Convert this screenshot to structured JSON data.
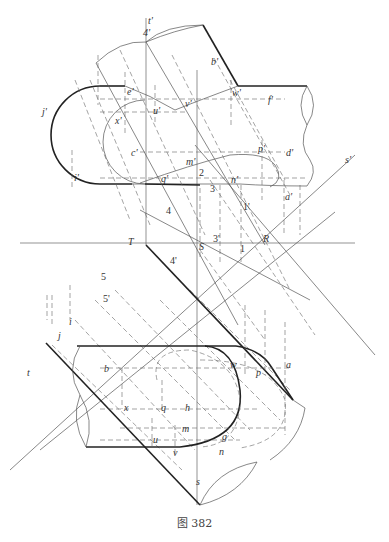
{
  "figure": {
    "caption": "图 382"
  },
  "labels": {
    "top_view": {
      "t_prime": "t'",
      "four_prime_top": "4'",
      "b_prime": "b'",
      "e_prime": "e'",
      "u_prime": "u'",
      "v_prime": "v'",
      "w_prime": "w'",
      "f_prime": "f'",
      "j_prime": "j'",
      "x_prime": "x'",
      "c_prime": "c'",
      "m_prime": "m'",
      "p_prime": "p'",
      "d_prime": "d'",
      "s_prime": "s'",
      "i_prime": "i'",
      "q_prime": "q'",
      "two": "2",
      "n_prime": "n'",
      "three": "3",
      "a_prime": "a'",
      "one_prime": "1'"
    },
    "middle": {
      "four": "4",
      "T": "T",
      "S": "S",
      "three_prime": "3'",
      "one": "1",
      "R": "R",
      "four_prime": "4'",
      "five": "5",
      "five_prime": "5'",
      "i": "i",
      "j": "j",
      "t": "t"
    },
    "bottom_view": {
      "b": "b",
      "w": "w",
      "p": "p",
      "a": "a",
      "x": "x",
      "q": "q",
      "h": "h",
      "m": "m",
      "u": "u",
      "v": "v",
      "g": "g",
      "n": "n",
      "s": "s"
    }
  }
}
